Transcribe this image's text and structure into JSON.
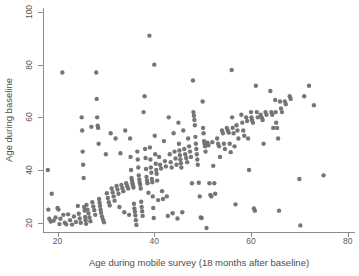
{
  "chart_data": {
    "type": "scatter",
    "title": "",
    "xlabel": "Age during mobile survey (18 months after baseline)",
    "ylabel": "Age during baseline",
    "xlim": [
      17.0,
      81.5
    ],
    "ylim": [
      16.5,
      101.5
    ],
    "xticks": [
      20,
      40,
      60,
      80
    ],
    "yticks": [
      20,
      40,
      60,
      80,
      100
    ],
    "xtick_labels": [
      "20",
      "40",
      "60",
      "80"
    ],
    "ytick_labels": [
      "20",
      "40",
      "60",
      "80",
      "100"
    ],
    "grid": false,
    "legend": null,
    "marker": {
      "shape": "circle",
      "color": "#6f6f6f",
      "size": 4.4,
      "opacity": 0.95
    },
    "series": [
      {
        "name": "participants",
        "points": [
          [
            18.0,
            40.0
          ],
          [
            18.1,
            25.0
          ],
          [
            18.3,
            21.5
          ],
          [
            18.6,
            20.5
          ],
          [
            18.8,
            31.0
          ],
          [
            19.2,
            20.8
          ],
          [
            19.6,
            22.0
          ],
          [
            20.0,
            25.6
          ],
          [
            20.2,
            25.0
          ],
          [
            20.4,
            19.5
          ],
          [
            20.6,
            21.5
          ],
          [
            21.0,
            77.0
          ],
          [
            21.2,
            23.0
          ],
          [
            21.5,
            20.0
          ],
          [
            21.8,
            19.4
          ],
          [
            22.2,
            23.2
          ],
          [
            22.6,
            21.0
          ],
          [
            23.0,
            19.3
          ],
          [
            23.4,
            22.4
          ],
          [
            23.8,
            20.3
          ],
          [
            24.2,
            26.4
          ],
          [
            24.4,
            23.4
          ],
          [
            24.6,
            21.6
          ],
          [
            24.8,
            20.0
          ],
          [
            25.0,
            60.0
          ],
          [
            25.1,
            55.0
          ],
          [
            25.2,
            47.0
          ],
          [
            25.3,
            42.0
          ],
          [
            25.4,
            37.0
          ],
          [
            25.5,
            26.0
          ],
          [
            25.6,
            24.6
          ],
          [
            25.7,
            22.2
          ],
          [
            25.8,
            21.0
          ],
          [
            25.9,
            19.6
          ],
          [
            26.0,
            26.8
          ],
          [
            26.2,
            25.0
          ],
          [
            26.4,
            23.6
          ],
          [
            26.6,
            22.0
          ],
          [
            26.8,
            20.6
          ],
          [
            27.0,
            56.4
          ],
          [
            27.2,
            27.8
          ],
          [
            27.4,
            26.2
          ],
          [
            27.6,
            24.8
          ],
          [
            27.8,
            23.0
          ],
          [
            28.0,
            77.0
          ],
          [
            28.1,
            67.0
          ],
          [
            28.2,
            60.0
          ],
          [
            28.3,
            56.8
          ],
          [
            28.4,
            56.0
          ],
          [
            28.5,
            50.0
          ],
          [
            28.6,
            29.0
          ],
          [
            28.7,
            27.6
          ],
          [
            28.8,
            26.4
          ],
          [
            28.9,
            25.0
          ],
          [
            29.0,
            23.8
          ],
          [
            29.2,
            22.4
          ],
          [
            29.4,
            21.2
          ],
          [
            29.6,
            20.2
          ],
          [
            30.0,
            46.0
          ],
          [
            30.2,
            31.2
          ],
          [
            30.4,
            29.4
          ],
          [
            30.6,
            27.8
          ],
          [
            30.8,
            26.6
          ],
          [
            31.0,
            54.0
          ],
          [
            31.2,
            33.0
          ],
          [
            31.4,
            31.6
          ],
          [
            31.6,
            30.0
          ],
          [
            31.8,
            28.4
          ],
          [
            32.0,
            52.0
          ],
          [
            32.2,
            34.0
          ],
          [
            32.4,
            32.6
          ],
          [
            32.6,
            31.0
          ],
          [
            32.8,
            26.0
          ],
          [
            33.0,
            46.4
          ],
          [
            33.2,
            34.4
          ],
          [
            33.4,
            33.2
          ],
          [
            33.6,
            32.0
          ],
          [
            33.8,
            24.0
          ],
          [
            34.0,
            55.0
          ],
          [
            34.2,
            35.0
          ],
          [
            34.4,
            34.0
          ],
          [
            34.6,
            33.0
          ],
          [
            34.8,
            23.0
          ],
          [
            35.0,
            52.0
          ],
          [
            35.1,
            45.0
          ],
          [
            35.2,
            40.0
          ],
          [
            35.3,
            37.0
          ],
          [
            35.4,
            36.0
          ],
          [
            35.5,
            35.0
          ],
          [
            35.6,
            34.2
          ],
          [
            35.7,
            33.4
          ],
          [
            35.8,
            27.2
          ],
          [
            35.9,
            25.4
          ],
          [
            36.0,
            24.2
          ],
          [
            36.1,
            22.8
          ],
          [
            36.2,
            21.0
          ],
          [
            36.3,
            19.2
          ],
          [
            36.5,
            47.0
          ],
          [
            36.6,
            44.0
          ],
          [
            36.7,
            41.0
          ],
          [
            36.8,
            38.0
          ],
          [
            36.9,
            36.4
          ],
          [
            37.0,
            35.2
          ],
          [
            37.1,
            34.4
          ],
          [
            37.2,
            33.0
          ],
          [
            37.3,
            28.0
          ],
          [
            37.4,
            26.0
          ],
          [
            37.5,
            24.4
          ],
          [
            37.6,
            22.6
          ],
          [
            37.8,
            62.0
          ],
          [
            38.0,
            68.0
          ],
          [
            38.1,
            48.0
          ],
          [
            38.2,
            44.6
          ],
          [
            38.3,
            40.4
          ],
          [
            38.4,
            37.4
          ],
          [
            38.5,
            36.0
          ],
          [
            38.6,
            35.0
          ],
          [
            38.8,
            31.4
          ],
          [
            39.0,
            91.0
          ],
          [
            39.1,
            48.6
          ],
          [
            39.2,
            44.0
          ],
          [
            39.3,
            41.0
          ],
          [
            39.4,
            39.0
          ],
          [
            39.5,
            36.6
          ],
          [
            39.6,
            35.4
          ],
          [
            39.7,
            30.0
          ],
          [
            39.8,
            25.6
          ],
          [
            39.9,
            21.8
          ],
          [
            40.0,
            80.0
          ],
          [
            40.1,
            53.0
          ],
          [
            40.2,
            46.0
          ],
          [
            40.3,
            42.4
          ],
          [
            40.4,
            40.0
          ],
          [
            40.5,
            38.6
          ],
          [
            40.6,
            36.0
          ],
          [
            40.8,
            28.6
          ],
          [
            41.0,
            45.0
          ],
          [
            41.2,
            42.0
          ],
          [
            41.4,
            40.6
          ],
          [
            41.6,
            32.0
          ],
          [
            41.8,
            29.0
          ],
          [
            42.0,
            51.0
          ],
          [
            42.2,
            43.4
          ],
          [
            42.4,
            41.4
          ],
          [
            42.6,
            30.0
          ],
          [
            42.8,
            22.6
          ],
          [
            43.0,
            60.0
          ],
          [
            43.2,
            46.0
          ],
          [
            43.4,
            43.0
          ],
          [
            43.6,
            41.0
          ],
          [
            43.8,
            23.6
          ],
          [
            44.0,
            54.0
          ],
          [
            44.2,
            47.0
          ],
          [
            44.4,
            44.4
          ],
          [
            44.6,
            42.0
          ],
          [
            44.8,
            21.6
          ],
          [
            45.0,
            58.0
          ],
          [
            45.1,
            50.0
          ],
          [
            45.2,
            47.4
          ],
          [
            45.3,
            45.6
          ],
          [
            45.4,
            44.0
          ],
          [
            45.5,
            42.6
          ],
          [
            45.6,
            41.0
          ],
          [
            45.8,
            24.0
          ],
          [
            46.0,
            55.0
          ],
          [
            46.2,
            48.0
          ],
          [
            46.4,
            46.0
          ],
          [
            46.6,
            44.6
          ],
          [
            46.8,
            43.0
          ],
          [
            47.0,
            52.0
          ],
          [
            47.2,
            49.0
          ],
          [
            47.4,
            47.0
          ],
          [
            47.6,
            45.0
          ],
          [
            47.8,
            35.0
          ],
          [
            48.0,
            74.0
          ],
          [
            48.1,
            62.0
          ],
          [
            48.2,
            60.6
          ],
          [
            48.3,
            59.0
          ],
          [
            48.4,
            57.0
          ],
          [
            48.5,
            52.6
          ],
          [
            48.6,
            50.0
          ],
          [
            48.7,
            48.0
          ],
          [
            48.8,
            46.0
          ],
          [
            48.9,
            44.0
          ],
          [
            49.0,
            42.0
          ],
          [
            49.2,
            35.2
          ],
          [
            49.4,
            30.0
          ],
          [
            49.6,
            22.0
          ],
          [
            49.8,
            21.8
          ],
          [
            50.0,
            66.0
          ],
          [
            50.1,
            56.0
          ],
          [
            50.2,
            54.0
          ],
          [
            50.3,
            51.0
          ],
          [
            50.4,
            50.0
          ],
          [
            50.5,
            49.0
          ],
          [
            50.6,
            47.0
          ],
          [
            50.8,
            18.0
          ],
          [
            51.0,
            50.4
          ],
          [
            51.2,
            49.4
          ],
          [
            51.4,
            35.0
          ],
          [
            51.6,
            30.6
          ],
          [
            51.8,
            30.0
          ],
          [
            52.0,
            50.6
          ],
          [
            52.2,
            41.6
          ],
          [
            52.4,
            35.0
          ],
          [
            52.6,
            31.0
          ],
          [
            53.0,
            52.0
          ],
          [
            53.2,
            50.0
          ],
          [
            53.4,
            49.0
          ],
          [
            53.6,
            45.0
          ],
          [
            54.0,
            55.0
          ],
          [
            54.2,
            54.0
          ],
          [
            54.4,
            50.0
          ],
          [
            54.6,
            48.0
          ],
          [
            55.0,
            56.0
          ],
          [
            55.2,
            55.0
          ],
          [
            55.4,
            54.2
          ],
          [
            55.6,
            50.0
          ],
          [
            55.8,
            46.8
          ],
          [
            56.0,
            78.0
          ],
          [
            56.1,
            60.0
          ],
          [
            56.2,
            56.0
          ],
          [
            56.4,
            54.0
          ],
          [
            56.6,
            49.0
          ],
          [
            56.8,
            27.0
          ],
          [
            57.0,
            57.0
          ],
          [
            57.2,
            55.0
          ],
          [
            57.4,
            52.0
          ],
          [
            58.0,
            61.0
          ],
          [
            58.2,
            58.0
          ],
          [
            58.4,
            55.0
          ],
          [
            58.6,
            53.0
          ],
          [
            59.0,
            60.0
          ],
          [
            59.2,
            58.6
          ],
          [
            59.4,
            52.0
          ],
          [
            59.6,
            40.0
          ],
          [
            60.0,
            62.0
          ],
          [
            60.1,
            60.0
          ],
          [
            60.2,
            59.0
          ],
          [
            60.4,
            58.0
          ],
          [
            60.6,
            25.4
          ],
          [
            60.8,
            24.6
          ],
          [
            61.0,
            72.0
          ],
          [
            61.2,
            62.0
          ],
          [
            61.4,
            60.0
          ],
          [
            62.0,
            61.0
          ],
          [
            62.2,
            60.0
          ],
          [
            62.4,
            59.0
          ],
          [
            62.6,
            50.0
          ],
          [
            63.0,
            62.0
          ],
          [
            63.2,
            61.0
          ],
          [
            64.0,
            70.0
          ],
          [
            64.2,
            62.0
          ],
          [
            64.4,
            61.0
          ],
          [
            64.6,
            56.0
          ],
          [
            65.0,
            66.6
          ],
          [
            65.1,
            62.0
          ],
          [
            65.2,
            58.0
          ],
          [
            65.4,
            56.0
          ],
          [
            65.6,
            52.0
          ],
          [
            65.8,
            24.6
          ],
          [
            66.0,
            66.0
          ],
          [
            66.2,
            63.4
          ],
          [
            66.4,
            62.0
          ],
          [
            67.0,
            66.0
          ],
          [
            67.2,
            65.0
          ],
          [
            68.0,
            68.0
          ],
          [
            68.2,
            67.0
          ],
          [
            70.0,
            36.6
          ],
          [
            70.2,
            19.0
          ],
          [
            71.0,
            68.0
          ],
          [
            72.0,
            72.0
          ],
          [
            73.0,
            64.6
          ],
          [
            75.0,
            38.0
          ]
        ]
      }
    ]
  }
}
